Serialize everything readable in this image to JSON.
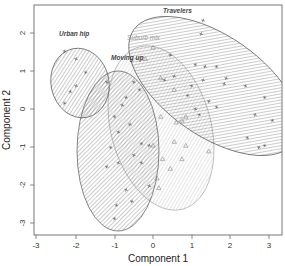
{
  "chart_data": {
    "type": "scatter",
    "title": "",
    "xlabel": "Component 1",
    "ylabel": "Component 2",
    "xlim": [
      -3.1,
      3.4
    ],
    "ylim": [
      -3.3,
      2.7
    ],
    "xticks": [
      -3,
      -2,
      -1,
      0,
      1,
      2,
      3
    ],
    "yticks": [
      -3,
      -2,
      -1,
      0,
      1,
      2
    ],
    "grid": false,
    "legend": "none (cluster labels drawn above ellipses)",
    "series": [
      {
        "name": "Urban hip",
        "marker": "cross",
        "ellipse": {
          "cx": -1.9,
          "cy": 0.7,
          "rx": 0.75,
          "ry": 0.9,
          "angle": -10
        },
        "points": [
          [
            -2.3,
            1.5
          ],
          [
            -2.0,
            1.3
          ],
          [
            -1.75,
            0.95
          ],
          [
            -2.0,
            0.6
          ],
          [
            -2.15,
            0.45
          ],
          [
            -2.3,
            0.15
          ],
          [
            -1.2,
            0.7
          ]
        ]
      },
      {
        "name": "Moving up",
        "marker": "cross",
        "ellipse": {
          "cx": -0.9,
          "cy": -1.1,
          "rx": 1.05,
          "ry": 2.1,
          "angle": 0
        },
        "points": [
          [
            -0.5,
            0.7
          ],
          [
            -0.35,
            0.5
          ],
          [
            -0.7,
            0.3
          ],
          [
            -0.8,
            0.1
          ],
          [
            -1.0,
            -0.2
          ],
          [
            -0.6,
            -0.4
          ],
          [
            -0.9,
            -0.6
          ],
          [
            -1.1,
            -1.0
          ],
          [
            -0.3,
            -0.9
          ],
          [
            -0.1,
            -0.95
          ],
          [
            -0.5,
            -1.2
          ],
          [
            -1.2,
            -1.5
          ],
          [
            -0.9,
            -1.4
          ],
          [
            -0.3,
            -1.4
          ],
          [
            -0.7,
            -2.1
          ],
          [
            -0.1,
            -2.0
          ],
          [
            -0.95,
            -2.5
          ],
          [
            -0.55,
            -2.4
          ],
          [
            -1.0,
            -2.85
          ]
        ]
      },
      {
        "name": "Suburb mix",
        "marker": "triangle",
        "ellipse": {
          "cx": 0.2,
          "cy": -0.5,
          "rx": 1.35,
          "ry": 2.2,
          "angle": -15
        },
        "points": [
          [
            0.0,
            1.6
          ],
          [
            -0.2,
            1.3
          ],
          [
            0.2,
            0.8
          ],
          [
            0.55,
            0.5
          ],
          [
            0.75,
            -0.3
          ],
          [
            0.85,
            -0.2
          ],
          [
            0.2,
            -0.2
          ],
          [
            0.6,
            -0.35
          ],
          [
            0.85,
            -0.95
          ],
          [
            0.55,
            -0.85
          ],
          [
            1.45,
            -1.1
          ],
          [
            0.75,
            -1.3
          ],
          [
            0.45,
            -1.55
          ],
          [
            0.25,
            -1.3
          ],
          [
            0.1,
            -1.8
          ],
          [
            0.15,
            -2.05
          ],
          [
            0.0,
            -0.95
          ]
        ]
      },
      {
        "name": "Travelers",
        "marker": "cross",
        "ellipse": {
          "cx": 1.6,
          "cy": 0.6,
          "rx": 2.6,
          "ry": 1.35,
          "angle": 35
        },
        "points": [
          [
            1.3,
            2.3
          ],
          [
            1.25,
            1.95
          ],
          [
            0.45,
            1.4
          ],
          [
            0.55,
            0.85
          ],
          [
            1.1,
            1.15
          ],
          [
            1.35,
            1.1
          ],
          [
            1.65,
            1.1
          ],
          [
            1.9,
            0.8
          ],
          [
            1.85,
            0.65
          ],
          [
            2.4,
            0.6
          ],
          [
            1.3,
            0.75
          ],
          [
            1.0,
            0.6
          ],
          [
            0.9,
            0.35
          ],
          [
            1.45,
            0.2
          ],
          [
            1.65,
            0.05
          ],
          [
            0.3,
            0.75
          ],
          [
            1.1,
            0.0
          ],
          [
            1.2,
            -0.15
          ],
          [
            2.9,
            0.3
          ],
          [
            2.65,
            -0.15
          ],
          [
            3.1,
            -0.3
          ],
          [
            2.45,
            -0.75
          ],
          [
            2.75,
            -1.0
          ],
          [
            2.9,
            -0.95
          ]
        ]
      }
    ]
  },
  "labels": {
    "xlabel": "Component 1",
    "ylabel": "Component 2",
    "clusters": {
      "urban_hip": "Urban hip",
      "moving_up": "Moving up",
      "suburb_mix": "Suburb mix",
      "travelers": "Travelers"
    },
    "xticks": [
      "-3",
      "-2",
      "-1",
      "0",
      "1",
      "2",
      "3"
    ],
    "yticks": [
      "-3",
      "-2",
      "-1",
      "0",
      "1",
      "2"
    ]
  },
  "colors": {
    "frame": "#555555",
    "dark_hatch": "#7a7a7a",
    "light_hatch": "#bdbdbd",
    "dark_outline": "#555555",
    "light_outline": "#aaaaaa",
    "points": "#555555"
  }
}
